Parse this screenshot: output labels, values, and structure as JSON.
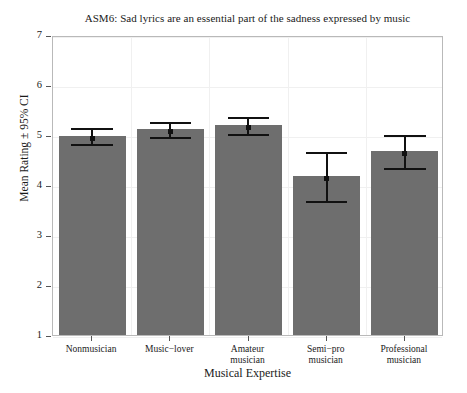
{
  "chart_data": {
    "type": "bar",
    "title": "ASM6: Sad lyrics are an essential part of the sadness expressed by music",
    "xlabel": "Musical Expertise",
    "ylabel": "Mean Rating ± 95% CI",
    "categories": [
      "Nonmusician",
      "Music−lover",
      "Amateur musician",
      "Semi−pro musician",
      "Professional musician"
    ],
    "category_lines": [
      [
        "Nonmusician"
      ],
      [
        "Music−lover"
      ],
      [
        "Amateur",
        "musician"
      ],
      [
        "Semi−pro",
        "musician"
      ],
      [
        "Professional",
        "musician"
      ]
    ],
    "values": [
      4.98,
      5.12,
      5.2,
      4.18,
      4.68
    ],
    "ci_lower": [
      4.82,
      4.96,
      5.02,
      3.68,
      4.34
    ],
    "ci_upper": [
      5.18,
      5.3,
      5.4,
      4.7,
      5.04
    ],
    "ylim": [
      1,
      7
    ],
    "yticks": [
      1,
      2,
      3,
      4,
      5,
      6,
      7
    ],
    "ytick_labels": [
      "1",
      "2",
      "3",
      "4",
      "5",
      "6",
      "7"
    ],
    "grid": true,
    "legend": "none",
    "bar_color": "#6e6e6e",
    "error_color": "#111111",
    "grid_color": "#f0f0f0",
    "frame_color": "#b9b9b9"
  }
}
